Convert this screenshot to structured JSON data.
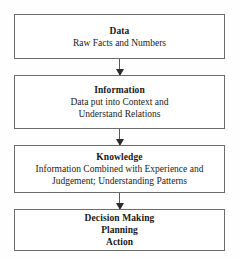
{
  "diagram": {
    "border_color": "#6b6b6b",
    "arrow_color": "#2b2b2b",
    "background_color": "#ffffff",
    "nodes": [
      {
        "id": "data",
        "heading": "Data",
        "lines": [
          "Raw Facts and Numbers"
        ],
        "bold_lines": false
      },
      {
        "id": "information",
        "heading": "Information",
        "lines": [
          "Data put into Context and",
          "Understand Relations"
        ],
        "bold_lines": false
      },
      {
        "id": "knowledge",
        "heading": "Knowledge",
        "lines": [
          "Information Combined with Experience and",
          "Judgement; Understanding Patterns"
        ],
        "bold_lines": false
      },
      {
        "id": "decision",
        "heading": "Decision Making",
        "lines": [
          "Planning",
          "Action"
        ],
        "bold_lines": true
      }
    ],
    "connectors": [
      {
        "id": "data-to-information",
        "from": "data",
        "to": "information",
        "style": "arrow-down"
      },
      {
        "id": "information-to-knowledge",
        "from": "information",
        "to": "knowledge",
        "style": "arrow-down"
      },
      {
        "id": "knowledge-to-decision",
        "from": "knowledge",
        "to": "decision",
        "style": "arrow-down"
      }
    ]
  }
}
